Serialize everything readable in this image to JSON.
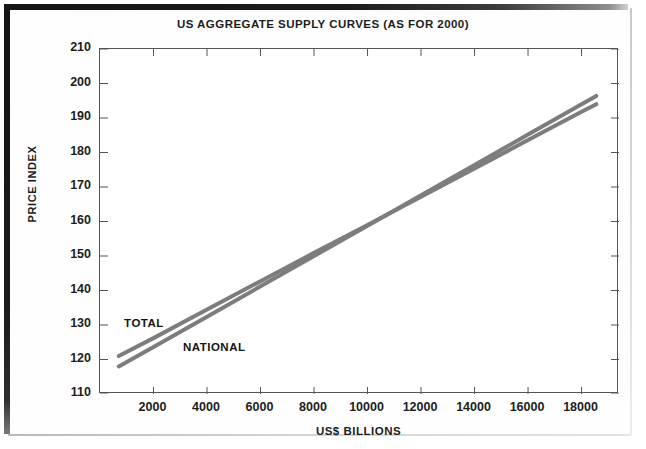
{
  "document": {
    "background_color": "#ffffff",
    "border_color": "#141414"
  },
  "chart_data": {
    "type": "line",
    "title": "US AGGREGATE SUPPLY CURVES (AS FOR 2000)",
    "xlabel": "US$ BILLIONS",
    "ylabel": "PRICE INDEX",
    "xlim": [
      0,
      19400
    ],
    "ylim": [
      110,
      210
    ],
    "xticks": [
      2000,
      4000,
      6000,
      8000,
      10000,
      12000,
      14000,
      16000,
      18000
    ],
    "xtick_labels": [
      "2000",
      "4000",
      "6000",
      "8000",
      "10000",
      "12000",
      "14000",
      "16000",
      "18000"
    ],
    "yticks": [
      110,
      120,
      130,
      140,
      150,
      160,
      170,
      180,
      190,
      200,
      210
    ],
    "ytick_labels": [
      "110",
      "120",
      "130",
      "140",
      "150",
      "160",
      "170",
      "180",
      "190",
      "200",
      "210"
    ],
    "grid": false,
    "legend_position": "inline-annotations",
    "line_color": "#7d7d7d",
    "line_width": 4,
    "series": [
      {
        "name": "TOTAL",
        "label": "TOTAL",
        "label_x": 900,
        "label_y": 130,
        "x": [
          700,
          2000,
          4000,
          6000,
          8000,
          10000,
          12000,
          14000,
          16000,
          18000,
          18550
        ],
        "y": [
          121.0,
          126.2,
          134.5,
          142.7,
          150.9,
          159.0,
          167.2,
          175.4,
          183.6,
          191.8,
          194.0
        ]
      },
      {
        "name": "NATIONAL",
        "label": "NATIONAL",
        "label_x": 3100,
        "label_y": 123,
        "x": [
          700,
          2000,
          4000,
          6000,
          8000,
          10000,
          12000,
          14000,
          16000,
          18000,
          18550
        ],
        "y": [
          118.0,
          123.6,
          132.4,
          141.2,
          150.0,
          158.8,
          167.6,
          176.4,
          185.2,
          194.0,
          196.4
        ]
      }
    ],
    "annotations": [
      {
        "text": "TOTAL",
        "x": 900,
        "y": 130
      },
      {
        "text": "NATIONAL",
        "x": 3100,
        "y": 123
      }
    ]
  }
}
